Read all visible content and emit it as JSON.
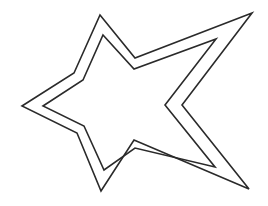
{
  "image": {
    "subject": "star-outline",
    "description": "Double-outlined five-pointed star line drawing",
    "background_color": "#ffffff",
    "stroke_color": "#2a2a2a",
    "stroke_width": 1.6,
    "outer_star_points": "100,15 135,58 252,13 182,105 249,189 134,140 101,191 77,133 22,106 74,73",
    "inner_star_points": "103,35 134,69 216,39 165,105 215,167 135,148 104,170 84,126 43,106 83,80"
  }
}
